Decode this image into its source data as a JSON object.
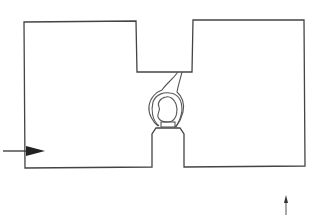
{
  "diagram": {
    "stroke_color": "#444444",
    "background_color": "#ffffff",
    "elements": {
      "chamber_outline": "chamber-outline",
      "central_structure": "loop-structure",
      "inlet_arrow": "right-arrow",
      "small_arrow": "up-arrow"
    }
  }
}
